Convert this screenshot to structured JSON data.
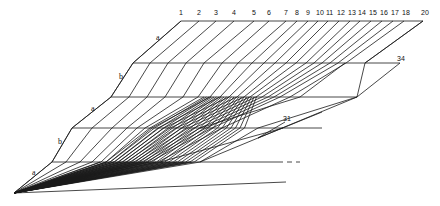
{
  "diagram": {
    "type": "line-drawing",
    "stroke_color": "#1a1a1a",
    "background": "#ffffff",
    "top_labels": [
      "1",
      "2",
      "3",
      "4",
      "5",
      "6",
      "7",
      "8",
      "9",
      "10",
      "11",
      "12",
      "13",
      "14",
      "15",
      "16",
      "17",
      "18",
      "20"
    ],
    "top_label_x": [
      181,
      199,
      216,
      234,
      254,
      269,
      286,
      297,
      308,
      318,
      328,
      339,
      350,
      360,
      371,
      382,
      393,
      404,
      423
    ],
    "levels": [
      {
        "y": 21,
        "x_start": 181,
        "x_end": 423
      },
      {
        "y": 63,
        "x_start": 133,
        "x_end": 400
      },
      {
        "y": 97,
        "x_start": 111,
        "x_end": 357
      },
      {
        "y": 128,
        "x_start": 72,
        "x_end": 322
      },
      {
        "y": 162,
        "x_start": 52,
        "x_end": 283
      }
    ],
    "origin": {
      "x": 14,
      "y": 193
    },
    "side_labels": [
      {
        "text": "a",
        "x": 156,
        "y": 40
      },
      {
        "text": "b",
        "x": 119,
        "y": 79
      },
      {
        "text": "a",
        "x": 91,
        "y": 111
      },
      {
        "text": "b",
        "x": 58,
        "y": 144
      },
      {
        "text": "a",
        "x": 32,
        "y": 175
      }
    ],
    "annotations": [
      {
        "text": "34",
        "x": 397,
        "y": 61
      },
      {
        "text": "31",
        "x": 283,
        "y": 121
      }
    ]
  }
}
